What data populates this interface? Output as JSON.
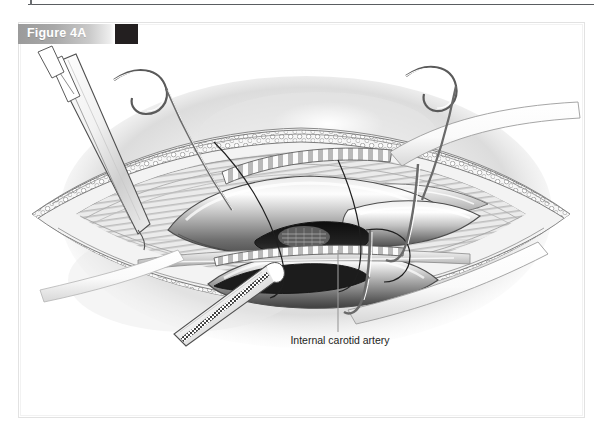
{
  "page": {
    "figure_label": "Figure 4A",
    "swatch_color": "#231f20",
    "bar_gradient_from": "#9b9b9b",
    "bar_gradient_to": "#ffffff",
    "rule_color": "#5a5d61",
    "frame_color": "#e2e2e2",
    "background": "#ffffff"
  },
  "illustration": {
    "title": "Carotid endarterectomy surgical field",
    "style": "grayscale pen-and-ink medical illustration",
    "caption": "Internal carotid artery",
    "caption_color": "#1d1d1b",
    "leader_line_color": "#9a9a9a",
    "ink_color": "#2b2b2b",
    "tissue_light": "#f4f4f4",
    "tissue_mid": "#c8c8c8",
    "tissue_dark": "#5e5e5e",
    "lumen_color": "#1a1a1a",
    "elements": [
      {
        "name": "skin-field-shadow",
        "label": "Skin field shadow"
      },
      {
        "name": "incision-opening",
        "label": "Neck incision"
      },
      {
        "name": "fat-layer-upper",
        "label": "Subcutaneous fat, upper margin"
      },
      {
        "name": "fat-layer-lower",
        "label": "Subcutaneous fat, lower margin"
      },
      {
        "name": "muscle-striations",
        "label": "Muscle striations"
      },
      {
        "name": "common-carotid-artery",
        "label": "Common carotid artery"
      },
      {
        "name": "internal-carotid-artery",
        "label": "Internal carotid artery"
      },
      {
        "name": "external-carotid-artery",
        "label": "External carotid artery"
      },
      {
        "name": "arteriotomy-lumen",
        "label": "Arteriotomy opening"
      },
      {
        "name": "plaque",
        "label": "Atherosclerotic plaque"
      },
      {
        "name": "forceps-instrument",
        "label": "Surgical forceps"
      },
      {
        "name": "serrated-instrument",
        "label": "Serrated dissector"
      },
      {
        "name": "retractor-hook-left",
        "label": "Retractor hook, left"
      },
      {
        "name": "retractor-hook-right",
        "label": "Retractor hook, right"
      },
      {
        "name": "vessel-loop-upper",
        "label": "Vessel loop, upper"
      },
      {
        "name": "vessel-loop-lower",
        "label": "Vessel loop, lower"
      },
      {
        "name": "suture-thread",
        "label": "Suture thread"
      },
      {
        "name": "drape-band-upper",
        "label": "Surgical drape, upper"
      },
      {
        "name": "drape-band-lower",
        "label": "Surgical drape, lower"
      }
    ]
  }
}
